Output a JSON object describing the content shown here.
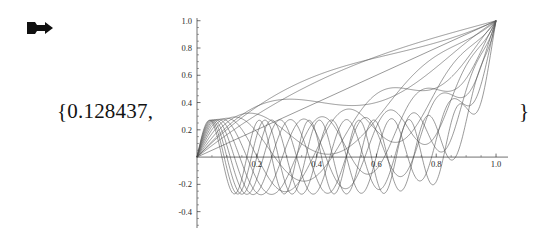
{
  "notebook": {
    "output_marker": {
      "icon": "right-arrow-icon",
      "label": "Out"
    },
    "expression": {
      "open_brace": "{0.128437,",
      "close_brace": "}",
      "value": "0.128437"
    }
  },
  "chart_data": {
    "type": "line",
    "title": "",
    "xlabel": "",
    "ylabel": "",
    "xlim": [
      0.0,
      1.04
    ],
    "ylim": [
      -0.52,
      1.02
    ],
    "grid": false,
    "legend": null,
    "axis_origin": [
      0.0,
      0.0
    ],
    "x_ticks": [
      0.2,
      0.4,
      0.6,
      0.8,
      1.0
    ],
    "x_tick_labels": [
      "0.2",
      "0.4",
      "0.6",
      "0.8",
      "1.0"
    ],
    "x_minor_tick_step": 0.05,
    "y_ticks": [
      -0.4,
      -0.2,
      0.2,
      0.4,
      0.6,
      0.8,
      1.0
    ],
    "y_tick_labels": [
      "-0.4",
      "-0.2",
      "0.2",
      "0.4",
      "0.6",
      "0.8",
      "1.0"
    ],
    "y_minor_tick_step": 0.05,
    "line_color": "#555555",
    "line_width": 0.6,
    "common_points": [
      [
        0.0,
        0.0
      ],
      [
        1.0,
        1.0
      ]
    ],
    "series": [
      {
        "name": "n=1",
        "modes": 1,
        "amplitude": 0.385,
        "power": 1.0
      },
      {
        "name": "n=2",
        "modes": 2,
        "amplitude": 0.33,
        "power": 1.4
      },
      {
        "name": "n=3",
        "modes": 3,
        "amplitude": 0.305,
        "power": 1.9
      },
      {
        "name": "n=4",
        "modes": 4,
        "amplitude": 0.292,
        "power": 2.5
      },
      {
        "name": "n=5",
        "modes": 5,
        "amplitude": 0.285,
        "power": 3.2
      },
      {
        "name": "n=6",
        "modes": 6,
        "amplitude": 0.28,
        "power": 4.0
      },
      {
        "name": "n=7",
        "modes": 7,
        "amplitude": 0.277,
        "power": 5.0
      },
      {
        "name": "n=8",
        "modes": 8,
        "amplitude": 0.275,
        "power": 6.2
      },
      {
        "name": "n=9",
        "modes": 9,
        "amplitude": 0.273,
        "power": 7.6
      },
      {
        "name": "n=10",
        "modes": 10,
        "amplitude": 0.272,
        "power": 9.2
      },
      {
        "name": "n=11",
        "modes": 11,
        "amplitude": 0.271,
        "power": 11.0
      },
      {
        "name": "n=12",
        "modes": 12,
        "amplitude": 0.27,
        "power": 13.0
      }
    ],
    "extra_curves": [
      {
        "name": "linear-ramp",
        "type": "straight",
        "from": [
          0.0,
          0.0
        ],
        "to": [
          1.0,
          1.0
        ]
      },
      {
        "name": "deep-trough",
        "modes": 0.5,
        "amplitude": 0.48,
        "power": 1.0
      }
    ]
  }
}
